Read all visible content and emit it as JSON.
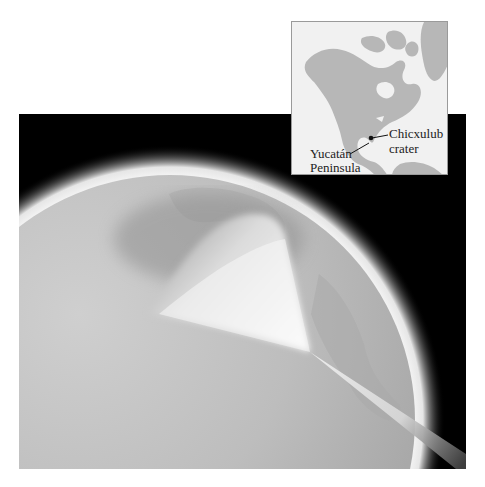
{
  "figure": {
    "main_panel": {
      "background": "#000000",
      "globe_color": "#bdbdbd",
      "atmosphere_color": "#f4f4f4",
      "ejecta_fan_color": "#f7f7f7",
      "impact_beam_color": "#e6e6e6"
    },
    "inset_map": {
      "background": "#f1f1f1",
      "land_color": "#b7b7b7",
      "labels": {
        "crater_line1": "Chicxulub",
        "crater_line2": "crater",
        "peninsula_line1": "Yucatán",
        "peninsula_line2": "Peninsula"
      },
      "marker_color": "#111111"
    }
  }
}
